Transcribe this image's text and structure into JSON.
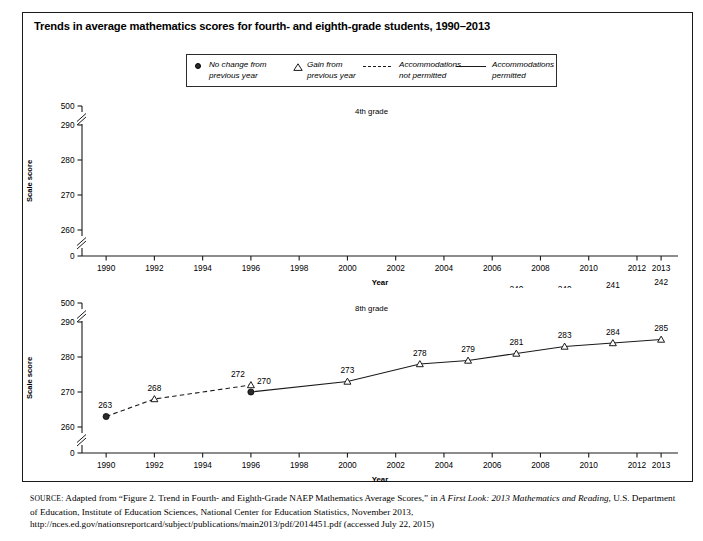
{
  "figure": {
    "title": "Trends in average mathematics scores for fourth- and eighth-grade students, 1990–2013",
    "source_prefix": "SOURCE:",
    "source_text_1": " Adapted from “Figure 2. Trend in Fourth- and Eighth-Grade NAEP Mathematics Average Scores,” in ",
    "source_italic_1": "A First Look: 2013 Mathematics and Reading,",
    "source_text_2": " U.S. Department of Education, Institute of Education Sciences, National Center for Education Statistics, November 2013, http://nces.ed.gov/nationsreportcard/subject/publications/main2013/pdf/2014451.pdf (accessed July 22, 2015)"
  },
  "legend": {
    "items": [
      {
        "marker": "filled-circle",
        "line1": "No change from",
        "line2": "previous year"
      },
      {
        "marker": "open-triangle",
        "line1": "Gain from",
        "line2": "previous year"
      },
      {
        "marker": "dashed-line",
        "line1": "Accommodations",
        "line2": "not permitted"
      },
      {
        "marker": "solid-line",
        "line1": "Accommodations",
        "line2": "permitted"
      }
    ]
  },
  "axes": {
    "ylabel": "Scale score",
    "xlabel": "Year",
    "ytick_labels": [
      "500",
      "290",
      "280",
      "270",
      "260",
      "0"
    ],
    "xtick_labels": [
      "1990",
      "1992",
      "1994",
      "1996",
      "1998",
      "2000",
      "2002",
      "2004",
      "2006",
      "2008",
      "2010",
      "2012",
      "2013"
    ]
  },
  "colors": {
    "line": "#1a1a1a",
    "marker_fill": "#2b2b2b",
    "text": "#000000",
    "frame": "#1a1a1a",
    "background": "#ffffff"
  },
  "chart_data": [
    {
      "type": "line",
      "title": "4th grade",
      "panel": "top",
      "xlabel": "Year",
      "ylabel": "Scale score",
      "ylim": [
        255,
        295
      ],
      "xlim": [
        1989,
        2013.6
      ],
      "grid": false,
      "axis_break": true,
      "ytick_labels": [
        "500",
        "290",
        "280",
        "270",
        "260",
        "0"
      ],
      "xtick_labels": [
        "1990",
        "1992",
        "1994",
        "1996",
        "1998",
        "2000",
        "2002",
        "2004",
        "2006",
        "2008",
        "2010",
        "2012",
        "2013"
      ],
      "points": [
        {
          "x": 1990,
          "y": 213,
          "label": "213",
          "marker": "filled-circle",
          "segment": "not-permitted"
        },
        {
          "x": 1992,
          "y": 220,
          "label": "220",
          "marker": "open-triangle",
          "segment": "not-permitted"
        },
        {
          "x": 1996,
          "y": 224,
          "label": "224",
          "marker": "open-triangle",
          "segment": "not-permitted"
        },
        {
          "x": 1996,
          "y": 224,
          "label": "224",
          "marker": "open-circle",
          "segment": "permitted"
        },
        {
          "x": 2000,
          "y": 226,
          "label": "226",
          "marker": "open-circle",
          "segment": "permitted"
        },
        {
          "x": 2003,
          "y": 235,
          "label": "235",
          "marker": "open-triangle",
          "segment": "permitted"
        },
        {
          "x": 2005,
          "y": 238,
          "label": "238",
          "marker": "open-triangle",
          "segment": "permitted"
        },
        {
          "x": 2007,
          "y": 240,
          "label": "240",
          "marker": "open-triangle",
          "segment": "permitted"
        },
        {
          "x": 2009,
          "y": 240,
          "label": "240",
          "marker": "filled-circle",
          "segment": "permitted"
        },
        {
          "x": 2011,
          "y": 241,
          "label": "241",
          "marker": "open-triangle",
          "segment": "permitted"
        },
        {
          "x": 2013,
          "y": 242,
          "label": "242",
          "marker": "open-triangle",
          "segment": "permitted"
        }
      ]
    },
    {
      "type": "line",
      "title": "8th grade",
      "panel": "bottom",
      "xlabel": "Year",
      "ylabel": "Scale score",
      "ylim": [
        255,
        295
      ],
      "xlim": [
        1989,
        2013.6
      ],
      "grid": false,
      "axis_break": true,
      "ytick_labels": [
        "500",
        "290",
        "280",
        "270",
        "260",
        "0"
      ],
      "xtick_labels": [
        "1990",
        "1992",
        "1994",
        "1996",
        "1998",
        "2000",
        "2002",
        "2004",
        "2006",
        "2008",
        "2010",
        "2012",
        "2013"
      ],
      "points": [
        {
          "x": 1990,
          "y": 263,
          "label": "263",
          "marker": "filled-circle",
          "segment": "not-permitted"
        },
        {
          "x": 1992,
          "y": 268,
          "label": "268",
          "marker": "open-triangle",
          "segment": "not-permitted"
        },
        {
          "x": 1996,
          "y": 272,
          "label": "272",
          "marker": "open-triangle",
          "segment": "not-permitted"
        },
        {
          "x": 1996,
          "y": 270,
          "label": "270",
          "marker": "filled-circle",
          "segment": "permitted"
        },
        {
          "x": 2000,
          "y": 273,
          "label": "273",
          "marker": "open-triangle",
          "segment": "permitted"
        },
        {
          "x": 2003,
          "y": 278,
          "label": "278",
          "marker": "open-triangle",
          "segment": "permitted"
        },
        {
          "x": 2005,
          "y": 279,
          "label": "279",
          "marker": "open-triangle",
          "segment": "permitted"
        },
        {
          "x": 2007,
          "y": 281,
          "label": "281",
          "marker": "open-triangle",
          "segment": "permitted"
        },
        {
          "x": 2009,
          "y": 283,
          "label": "283",
          "marker": "open-triangle",
          "segment": "permitted"
        },
        {
          "x": 2011,
          "y": 284,
          "label": "284",
          "marker": "open-triangle",
          "segment": "permitted"
        },
        {
          "x": 2013,
          "y": 285,
          "label": "285",
          "marker": "open-triangle",
          "segment": "permitted"
        }
      ]
    }
  ]
}
